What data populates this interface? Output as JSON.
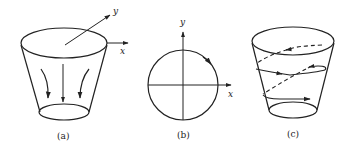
{
  "colors": {
    "stroke": "#222222",
    "background": "#ffffff"
  },
  "panels": [
    {
      "id": "a",
      "caption": "(a)",
      "axes": {
        "x_label": "x",
        "y_label": "y"
      },
      "description": "truncated cone (frustum) with top and bottom ellipses; vertical downward arrow in center and two curved arrows on sides"
    },
    {
      "id": "b",
      "caption": "(b)",
      "axes": {
        "x_label": "x",
        "y_label": "y"
      },
      "description": "circle centered at origin of x-y axes with a direction arrow on the upper-right arc"
    },
    {
      "id": "c",
      "caption": "(c)",
      "axes": {},
      "description": "truncated cone with helical path: solid lines on front, dashed lines on back, with arrowheads"
    }
  ]
}
